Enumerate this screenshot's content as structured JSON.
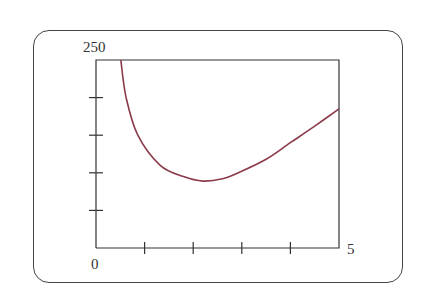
{
  "window": {
    "frame": "rounded-rectangle calculator-style viewing window"
  },
  "chart_data": {
    "type": "line",
    "title": "",
    "xlabel": "",
    "ylabel": "",
    "xlim": [
      0,
      5
    ],
    "ylim": [
      0,
      250
    ],
    "x_tick_labels": {
      "min": "0",
      "max": "5"
    },
    "y_tick_labels": {
      "max": "250"
    },
    "x_ticks": [
      1,
      2,
      3,
      4
    ],
    "y_ticks": [
      50,
      100,
      150,
      200
    ],
    "grid": false,
    "legend": null,
    "series": [
      {
        "name": "curve",
        "color": "#8b3a4a",
        "x": [
          0.51,
          0.62,
          0.86,
          1.32,
          1.8,
          2.2,
          2.6,
          2.96,
          3.5,
          4.0,
          4.5,
          5.0
        ],
        "values": [
          250,
          200,
          150,
          110,
          95,
          89,
          92,
          101,
          118,
          140,
          162,
          185
        ]
      }
    ]
  },
  "labels": {
    "y_max": "250",
    "x_min": "0",
    "x_max": "5"
  }
}
